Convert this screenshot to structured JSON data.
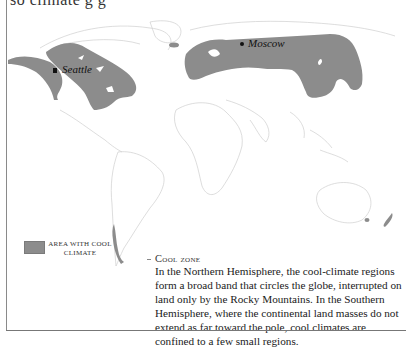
{
  "heading_fragment": "so climate g g",
  "map": {
    "fill_color": "#8c8c8c",
    "outline_color": "#cfcfcf",
    "cities": [
      {
        "name": "Seattle",
        "marker": "square"
      },
      {
        "name": "Moscow",
        "marker": "circle"
      }
    ]
  },
  "legend": {
    "swatch_color": "#8c8c8c",
    "label": "Area with cool climate"
  },
  "caption": {
    "title": "Cool zone",
    "body": "In the Northern Hemisphere, the cool-climate regions form a broad band that circles the globe, interrupted on land only by the Rocky Mountains. In the Southern Hemisphere, where the continental land masses do not extend as far toward the pole, cool climates are confined to a few small regions."
  }
}
